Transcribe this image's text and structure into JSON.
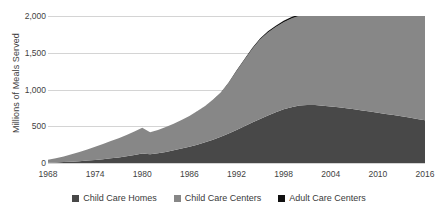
{
  "chart_data": {
    "type": "area",
    "stacked": true,
    "title": "",
    "subtitle": "",
    "xlabel": "",
    "ylabel": "Millions of Meals Served",
    "xlim": [
      1968,
      2016
    ],
    "ylim": [
      0,
      2000
    ],
    "grid": true,
    "legend_position": "bottom",
    "ytick_labels": [
      "0",
      "500",
      "1,000",
      "1,500",
      "2,000"
    ],
    "ytick_values": [
      0,
      500,
      1000,
      1500,
      2000
    ],
    "xtick_labels": [
      "1968",
      "1974",
      "1980",
      "1986",
      "1992",
      "1998",
      "2004",
      "2010",
      "2016"
    ],
    "xtick_values": [
      1968,
      1974,
      1980,
      1986,
      1992,
      1998,
      2004,
      2010,
      2016
    ],
    "x": [
      1968,
      1969,
      1970,
      1971,
      1972,
      1973,
      1974,
      1975,
      1976,
      1977,
      1978,
      1979,
      1980,
      1981,
      1982,
      1983,
      1984,
      1985,
      1986,
      1987,
      1988,
      1989,
      1990,
      1991,
      1992,
      1993,
      1994,
      1995,
      1996,
      1997,
      1998,
      1999,
      2000,
      2001,
      2002,
      2003,
      2004,
      2005,
      2006,
      2007,
      2008,
      2009,
      2010,
      2011,
      2012,
      2013,
      2014,
      2015,
      2016
    ],
    "series": [
      {
        "name": "Child Care Homes",
        "color": "#484848",
        "values": [
          5,
          8,
          12,
          18,
          25,
          33,
          42,
          52,
          63,
          76,
          92,
          110,
          128,
          118,
          132,
          150,
          172,
          196,
          222,
          250,
          282,
          318,
          356,
          400,
          450,
          500,
          552,
          600,
          645,
          690,
          730,
          760,
          782,
          790,
          788,
          780,
          770,
          758,
          745,
          730,
          715,
          700,
          684,
          668,
          652,
          636,
          620,
          600,
          580
        ]
      },
      {
        "name": "Child Care Centers",
        "color": "#878787",
        "values": [
          40,
          58,
          78,
          100,
          124,
          150,
          178,
          208,
          236,
          262,
          288,
          318,
          352,
          300,
          318,
          340,
          362,
          388,
          418,
          452,
          492,
          540,
          600,
          690,
          800,
          900,
          1000,
          1080,
          1130,
          1160,
          1185,
          1205,
          1222,
          1235,
          1248,
          1262,
          1275,
          1288,
          1302,
          1318,
          1335,
          1352,
          1372,
          1392,
          1412,
          1432,
          1452,
          1472,
          1492
        ]
      },
      {
        "name": "Adult Care Centers",
        "color": "#111111",
        "values": [
          0,
          0,
          0,
          0,
          0,
          0,
          0,
          0,
          0,
          0,
          0,
          0,
          0,
          0,
          0,
          0,
          0,
          0,
          0,
          1,
          2,
          3,
          4,
          6,
          8,
          10,
          12,
          14,
          16,
          18,
          20,
          21,
          22,
          23,
          24,
          25,
          26,
          27,
          28,
          29,
          30,
          31,
          32,
          33,
          34,
          35,
          36,
          37,
          38
        ]
      }
    ],
    "legend": [
      {
        "label": "Child Care Homes",
        "color": "#484848"
      },
      {
        "label": "Child Care Centers",
        "color": "#878787"
      },
      {
        "label": "Adult Care Centers",
        "color": "#111111"
      }
    ]
  }
}
